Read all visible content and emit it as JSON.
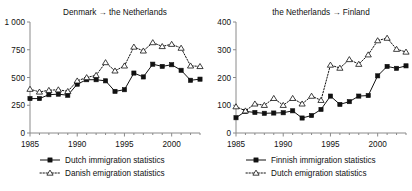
{
  "figure": {
    "background": "#ffffff",
    "axis_color": "#8a8a8a",
    "series_color": "#111111"
  },
  "chart_data": [
    {
      "type": "line",
      "panel": "left",
      "title": "Denmark → the Netherlands",
      "xlabel": "",
      "ylabel": "",
      "xlim": [
        1985,
        2003
      ],
      "ylim": [
        0,
        1000
      ],
      "xticks": [
        1985,
        1990,
        1995,
        2000
      ],
      "xticklabels": [
        "1985",
        "1990",
        "1995",
        "2000"
      ],
      "yticks": [
        0,
        250,
        500,
        750,
        1000
      ],
      "yticklabels": [
        "0",
        "250",
        "500",
        "750",
        "1 000"
      ],
      "grid": false,
      "legend_position": "bottom",
      "x": [
        1985,
        1986,
        1987,
        1988,
        1989,
        1990,
        1991,
        1992,
        1993,
        1994,
        1995,
        1996,
        1997,
        1998,
        1999,
        2000,
        2001,
        2002,
        2003
      ],
      "series": [
        {
          "name": "Dutch immigration statistics",
          "marker": "filled-square",
          "linestyle": "solid",
          "values": [
            310,
            310,
            345,
            350,
            340,
            440,
            480,
            480,
            470,
            375,
            390,
            540,
            505,
            620,
            600,
            615,
            565,
            475,
            485
          ]
        },
        {
          "name": "Danish emigration statistics",
          "marker": "open-triangle",
          "linestyle": "dotted",
          "values": [
            395,
            370,
            385,
            390,
            375,
            470,
            500,
            520,
            635,
            560,
            605,
            775,
            740,
            815,
            780,
            800,
            765,
            605,
            600
          ]
        }
      ]
    },
    {
      "type": "line",
      "panel": "right",
      "title": "the Netherlands → Finland",
      "xlabel": "",
      "ylabel": "",
      "xlim": [
        1985,
        2003
      ],
      "ylim": [
        0,
        400
      ],
      "xticks": [
        1985,
        1990,
        1995,
        2000
      ],
      "xticklabels": [
        "1985",
        "1990",
        "1995",
        "2000"
      ],
      "yticks": [
        0,
        100,
        200,
        300,
        400
      ],
      "yticklabels": [
        "0",
        "100",
        "200",
        "300",
        "400"
      ],
      "grid": false,
      "legend_position": "bottom",
      "x": [
        1985,
        1986,
        1987,
        1988,
        1989,
        1990,
        1991,
        1992,
        1993,
        1994,
        1995,
        1996,
        1997,
        1998,
        1999,
        2000,
        2001,
        2002,
        2003
      ],
      "series": [
        {
          "name": "Finnish immigration statistics",
          "marker": "filled-square",
          "linestyle": "solid",
          "values": [
            55,
            78,
            74,
            71,
            72,
            73,
            80,
            54,
            63,
            85,
            133,
            103,
            113,
            133,
            135,
            206,
            240,
            233,
            242
          ]
        },
        {
          "name": "Dutch emigration statistics",
          "marker": "open-triangle",
          "linestyle": "dotted",
          "values": [
            95,
            80,
            105,
            100,
            125,
            100,
            125,
            105,
            133,
            118,
            245,
            234,
            265,
            248,
            282,
            333,
            342,
            302,
            292
          ]
        }
      ]
    }
  ],
  "legends": {
    "left": [
      {
        "label": "Dutch immigration statistics",
        "marker": "filled-square",
        "linestyle": "solid"
      },
      {
        "label": "Danish emigration statistics",
        "marker": "open-triangle",
        "linestyle": "dotted"
      }
    ],
    "right": [
      {
        "label": "Finnish immigration statistics",
        "marker": "filled-square",
        "linestyle": "solid"
      },
      {
        "label": "Dutch emigration statistics",
        "marker": "open-triangle",
        "linestyle": "dotted"
      }
    ]
  }
}
